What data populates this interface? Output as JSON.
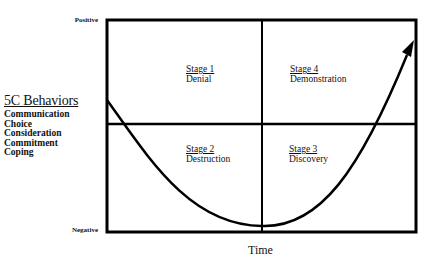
{
  "diagram": {
    "axis": {
      "y_top": "Positive",
      "y_bottom": "Negative",
      "x": "Time"
    },
    "behaviors": {
      "title": "5C Behaviors",
      "items": [
        "Communication",
        "Choice",
        "Consideration",
        "Commitment",
        "Coping"
      ]
    },
    "stages": [
      {
        "num": "Stage 1",
        "name": "Denial"
      },
      {
        "num": "Stage 2",
        "name": "Destruction"
      },
      {
        "num": "Stage 3",
        "name": "Discovery"
      },
      {
        "num": "Stage 4",
        "name": "Demonstration"
      }
    ],
    "colors": {
      "line": "#000000",
      "background": "#ffffff"
    }
  }
}
